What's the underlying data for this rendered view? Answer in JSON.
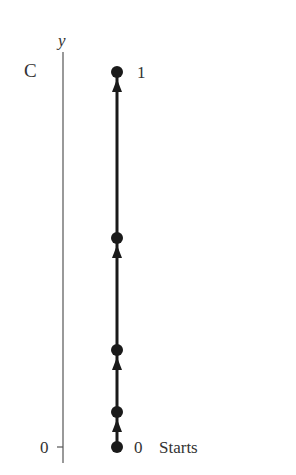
{
  "diagram": {
    "axis_label": "y",
    "top_label": "C",
    "zero_tick_label": "0",
    "top_point_label": "1",
    "bottom_point_label": "0",
    "start_label": "Starts",
    "points_y_px": [
      447,
      412,
      350,
      238,
      72
    ],
    "colors": {
      "ink": "#1a1a1a",
      "axis": "#555555"
    }
  }
}
